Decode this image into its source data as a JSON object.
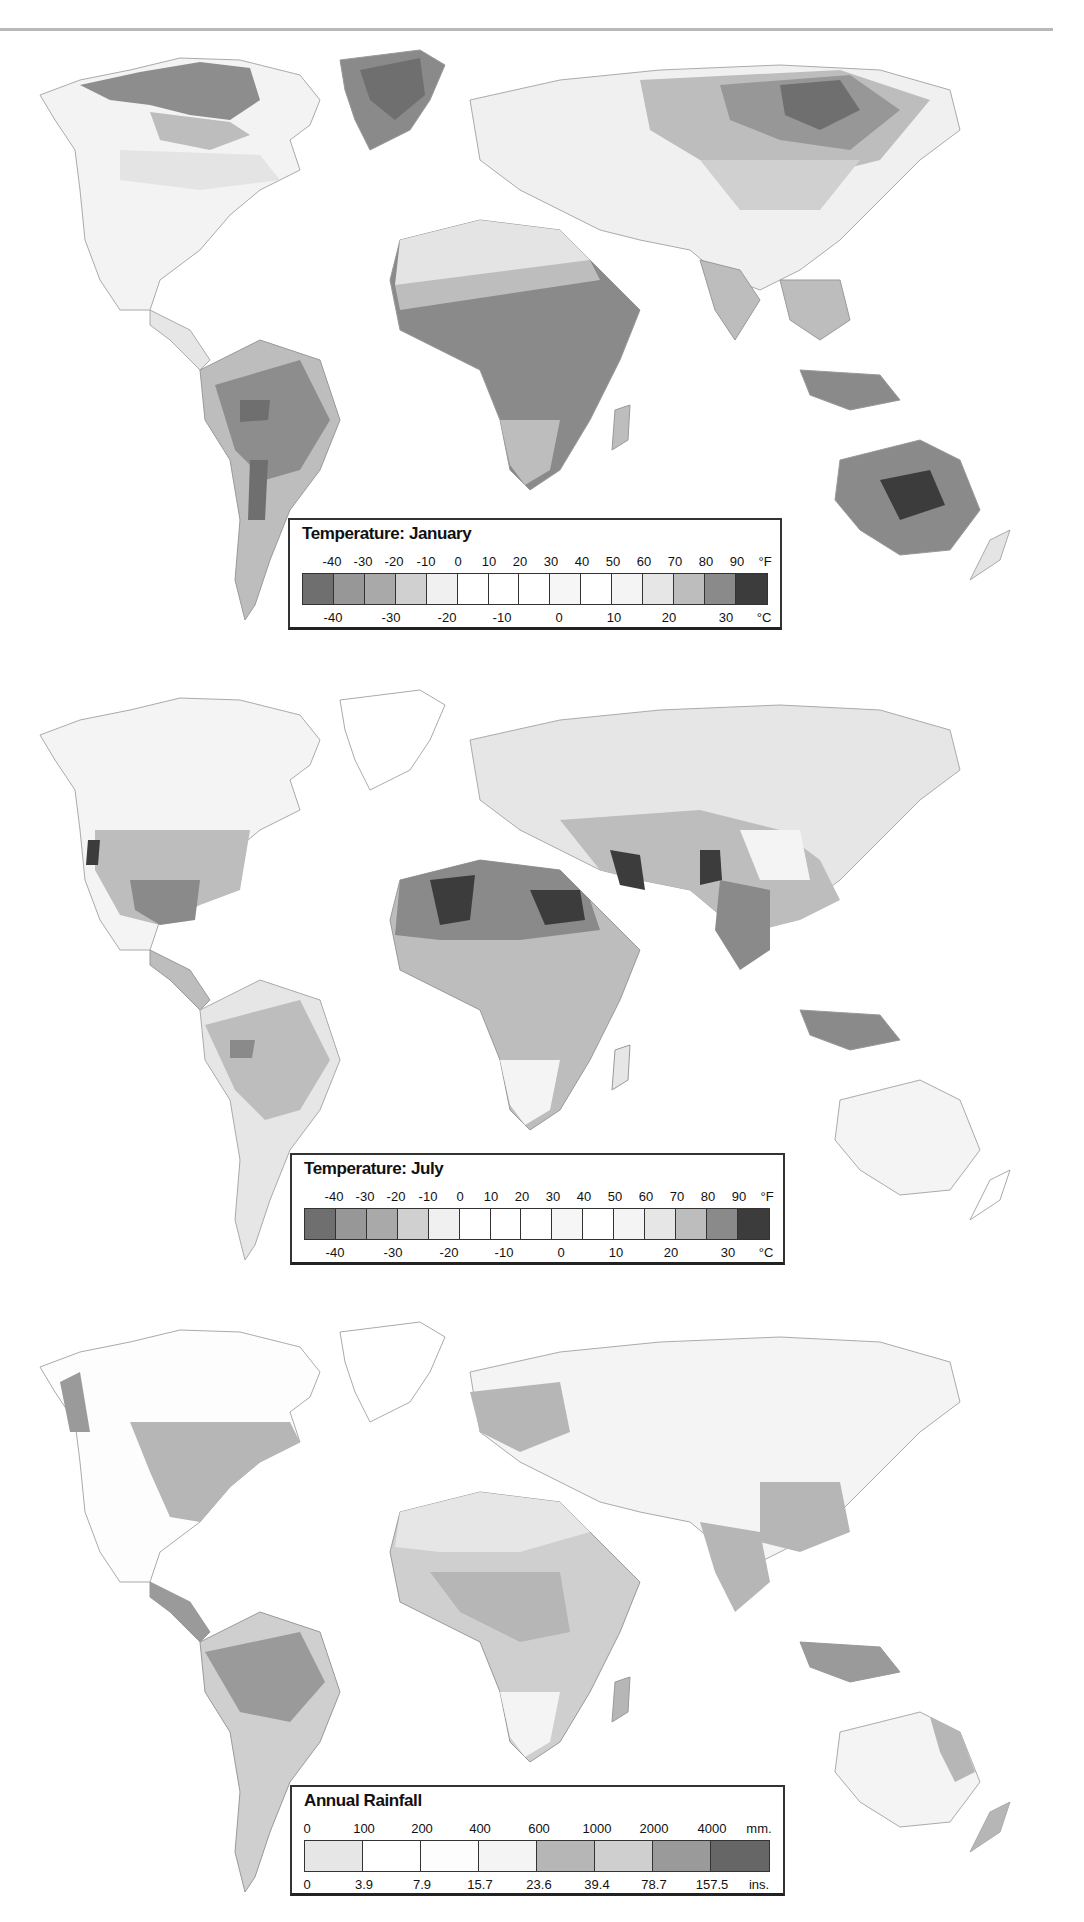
{
  "maps": [
    {
      "id": "january",
      "legend": {
        "title": "Temperature: January",
        "top_unit": "°F",
        "top_labels": [
          "-40",
          "-30",
          "-20",
          "-10",
          "0",
          "10",
          "20",
          "30",
          "40",
          "50",
          "60",
          "70",
          "80",
          "90"
        ],
        "bottom_unit": "°C",
        "bottom_labels": [
          "-40",
          "-30",
          "-20",
          "-10",
          "0",
          "10",
          "20",
          "30"
        ],
        "swatch_colors": [
          "#6f6f6f",
          "#979797",
          "#a9a9a9",
          "#d0d0d0",
          "#f0f0f0",
          "#ffffff",
          "#ffffff",
          "#ffffff",
          "#f6f6f6",
          "#ffffff",
          "#f4f4f4",
          "#e6e6e6",
          "#bdbdbd",
          "#8a8a8a",
          "#3c3c3c"
        ]
      }
    },
    {
      "id": "july",
      "legend": {
        "title": "Temperature: July",
        "top_unit": "°F",
        "top_labels": [
          "-40",
          "-30",
          "-20",
          "-10",
          "0",
          "10",
          "20",
          "30",
          "40",
          "50",
          "60",
          "70",
          "80",
          "90"
        ],
        "bottom_unit": "°C",
        "bottom_labels": [
          "-40",
          "-30",
          "-20",
          "-10",
          "0",
          "10",
          "20",
          "30"
        ],
        "swatch_colors": [
          "#6f6f6f",
          "#979797",
          "#a9a9a9",
          "#d0d0d0",
          "#f0f0f0",
          "#ffffff",
          "#ffffff",
          "#ffffff",
          "#f6f6f6",
          "#ffffff",
          "#f4f4f4",
          "#e6e6e6",
          "#bdbdbd",
          "#8a8a8a",
          "#3c3c3c"
        ]
      }
    },
    {
      "id": "rainfall",
      "legend": {
        "title": "Annual Rainfall",
        "top_unit": "mm.",
        "top_labels": [
          "0",
          "100",
          "200",
          "400",
          "600",
          "1000",
          "2000",
          "4000"
        ],
        "bottom_unit": "ins.",
        "bottom_labels": [
          "0",
          "3.9",
          "7.9",
          "15.7",
          "23.6",
          "39.4",
          "78.7",
          "157.5"
        ],
        "swatch_colors": [
          "#e6e6e6",
          "#ffffff",
          "#fdfdfd",
          "#f4f4f4",
          "#b6b6b6",
          "#cfcfcf",
          "#9a9a9a",
          "#666666"
        ]
      }
    }
  ],
  "chart_data": [
    {
      "type": "heatmap",
      "title": "Temperature: January",
      "scale_fahrenheit": [
        -40,
        -30,
        -20,
        -10,
        0,
        10,
        20,
        30,
        40,
        50,
        60,
        70,
        80,
        90
      ],
      "scale_celsius": [
        -40,
        -30,
        -20,
        -10,
        0,
        10,
        20,
        30
      ],
      "classes": 15,
      "legend_position": "bottom-center",
      "notes": "Coldest (darkest) over Siberia, Greenland, northern Canada; hottest over interior Australia"
    },
    {
      "type": "heatmap",
      "title": "Temperature: July",
      "scale_fahrenheit": [
        -40,
        -30,
        -20,
        -10,
        0,
        10,
        20,
        30,
        40,
        50,
        60,
        70,
        80,
        90
      ],
      "scale_celsius": [
        -40,
        -30,
        -20,
        -10,
        0,
        10,
        20,
        30
      ],
      "classes": 15,
      "legend_position": "bottom-center",
      "notes": "Hottest (darkest) over Sahara, Arabia, Iran/Pakistan, SW USA"
    },
    {
      "type": "heatmap",
      "title": "Annual Rainfall",
      "scale_mm": [
        0,
        100,
        200,
        400,
        600,
        1000,
        2000,
        4000
      ],
      "scale_inches": [
        0,
        3.9,
        7.9,
        15.7,
        23.6,
        39.4,
        78.7,
        157.5
      ],
      "classes": 8,
      "legend_position": "bottom-center",
      "notes": "Wettest over Amazon, Congo basin, SE Asia, Indonesia"
    }
  ]
}
